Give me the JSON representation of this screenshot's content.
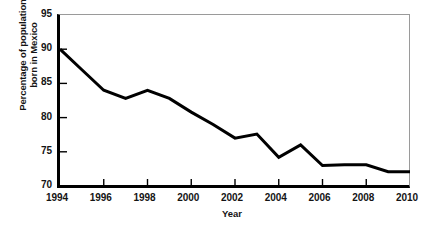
{
  "chart_data": {
    "type": "line",
    "title": "",
    "xlabel": "Year",
    "ylabel_lines": [
      "Percentage of population",
      "born in Mexico"
    ],
    "ylabel": "Percentage of population born in Mexico",
    "x": [
      1994,
      1995,
      1996,
      1997,
      1998,
      1999,
      2000,
      2001,
      2002,
      2003,
      2004,
      2005,
      2006,
      2007,
      2008,
      2009,
      2010
    ],
    "values": [
      90.0,
      87.0,
      84.0,
      82.8,
      84.0,
      82.8,
      80.8,
      79.0,
      77.0,
      77.6,
      74.2,
      76.0,
      73.0,
      73.1,
      73.1,
      72.1,
      72.1
    ],
    "series": [
      {
        "name": "Percentage of population born in Mexico",
        "values": [
          90.0,
          87.0,
          84.0,
          82.8,
          84.0,
          82.8,
          80.8,
          79.0,
          77.0,
          77.6,
          74.2,
          76.0,
          73.0,
          73.1,
          73.1,
          72.1,
          72.1
        ]
      }
    ],
    "xlim": [
      1994,
      2010
    ],
    "ylim": [
      70,
      95
    ],
    "ytick_values": [
      70,
      75,
      80,
      85,
      90,
      95
    ],
    "ytick_labels": [
      "70",
      "75",
      "80",
      "85",
      "90",
      "95"
    ],
    "xtick_values": [
      1994,
      1996,
      1998,
      2000,
      2002,
      2004,
      2006,
      2008,
      2010
    ],
    "xtick_labels": [
      "1994",
      "1996",
      "1998",
      "2000",
      "2002",
      "2004",
      "2006",
      "2008",
      "2010"
    ],
    "minor_xtick_values": [
      1995,
      1997,
      1999,
      2001,
      2003,
      2005,
      2007,
      2009
    ],
    "grid": false,
    "legend": false,
    "legend_position": "none",
    "line_color": "#000000",
    "line_width_px": 3,
    "axis_color": "#000000",
    "frame_color": "#9a9a9a",
    "background_color": "#ffffff"
  }
}
